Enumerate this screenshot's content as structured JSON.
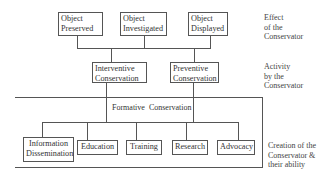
{
  "diagram": {
    "levels": [
      {
        "side_label": "Effect\nof the\nConservator",
        "side_label_lines": [
          "Effect",
          "of the",
          "Conservator"
        ],
        "nodes": [
          {
            "id": "object-preserved",
            "lines": [
              "Object",
              "Preserved"
            ]
          },
          {
            "id": "object-investigated",
            "lines": [
              "Object",
              "Investigated"
            ]
          },
          {
            "id": "object-displayed",
            "lines": [
              "Object",
              "Displayed"
            ]
          }
        ]
      },
      {
        "side_label_lines": [
          "Activity",
          "by the",
          "Conservator"
        ],
        "nodes": [
          {
            "id": "interventive-conservation",
            "lines": [
              "Interventive",
              "Conservation"
            ]
          },
          {
            "id": "preventive-conservation",
            "lines": [
              "Preventive",
              "Conservation"
            ]
          }
        ]
      },
      {
        "side_label_lines": [
          "Creation of the",
          "Conservator &",
          "their ability"
        ],
        "group_label": "Formative  Conservation",
        "nodes": [
          {
            "id": "information-dissemination",
            "lines": [
              "Information",
              "Dissemination"
            ]
          },
          {
            "id": "education",
            "lines": [
              "Education"
            ]
          },
          {
            "id": "training",
            "lines": [
              "Training"
            ]
          },
          {
            "id": "research",
            "lines": [
              "Research"
            ]
          },
          {
            "id": "advocacy",
            "lines": [
              "Advocacy"
            ]
          }
        ]
      }
    ]
  }
}
